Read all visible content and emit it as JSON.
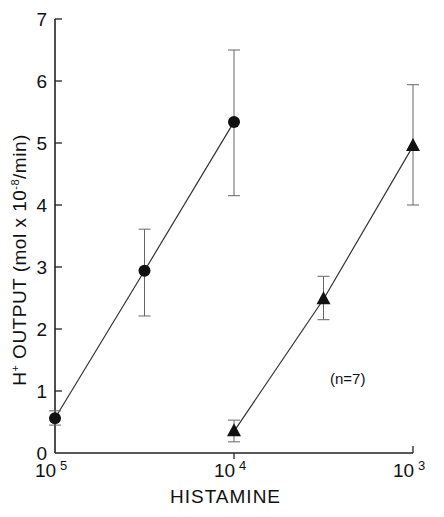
{
  "chart_data": {
    "type": "line",
    "title": "",
    "xlabel": "HISTAMINE",
    "ylabel": "H+ OUTPUT (mol x 10-8/min)",
    "ylabel_parts": {
      "main": "H",
      "sup1": "+",
      "mid": "OUTPUT (mol x 10",
      "sup2": "-8",
      "end": "/min)"
    },
    "x_scale": "log (molar concentration, decreasing exponent)",
    "x_ticks": [
      {
        "base": "10",
        "exp": "5",
        "pos": 0
      },
      {
        "base": "10",
        "exp": "4",
        "pos": 1
      },
      {
        "base": "10",
        "exp": "3",
        "pos": 2
      }
    ],
    "y_ticks": [
      0,
      1,
      2,
      3,
      4,
      5,
      6,
      7
    ],
    "ylim": [
      0,
      7
    ],
    "grid": false,
    "annotation": "(n=7)",
    "series": [
      {
        "name": "circles",
        "marker": "circle",
        "x_pos": [
          0,
          0.5,
          1
        ],
        "x_label": [
          "10^-5",
          "3x10^-5",
          "10^-4"
        ],
        "values": [
          0.56,
          2.94,
          5.34
        ],
        "err_low": [
          0.45,
          2.21,
          4.15
        ],
        "err_high": [
          0.68,
          3.61,
          6.5
        ]
      },
      {
        "name": "triangles",
        "marker": "triangle",
        "x_pos": [
          1,
          1.5,
          2
        ],
        "x_label": [
          "10^-4",
          "3x10^-4",
          "10^-3"
        ],
        "values": [
          0.35,
          2.48,
          4.95
        ],
        "err_low": [
          0.18,
          2.15,
          4.0
        ],
        "err_high": [
          0.53,
          2.85,
          5.94
        ]
      }
    ]
  }
}
